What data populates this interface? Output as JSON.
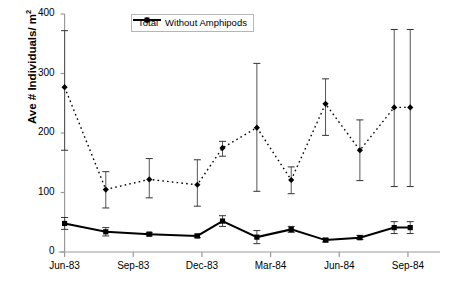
{
  "chart_data": {
    "type": "line",
    "title": "",
    "xlabel": "",
    "ylabel": "Ave # Individuals/ m",
    "ylabel_sup": "2",
    "ylim": [
      0,
      400
    ],
    "yticks": [
      0,
      100,
      200,
      300,
      400
    ],
    "ytick_labels": [
      "0",
      "100",
      "200",
      "300",
      "400"
    ],
    "xtick_labels": [
      "Jun-83",
      "Sep-83",
      "Dec-83",
      "Mar-84",
      "Jun-84",
      "Sep-84"
    ],
    "xtick_months": [
      0,
      3,
      6,
      9,
      12,
      15
    ],
    "xlim_months": [
      -0.2,
      16.4
    ],
    "grid": false,
    "legend_position": "top-center",
    "x_months": [
      0,
      1.8,
      3.7,
      5.8,
      6.9,
      8.4,
      9.9,
      11.4,
      12.9,
      14.4,
      15.1
    ],
    "series": [
      {
        "name": "Total",
        "style": "dashed",
        "marker": "diamond",
        "color": "#000000",
        "values": [
          277,
          105,
          122,
          113,
          175,
          209,
          121,
          249,
          171,
          243,
          243
        ],
        "err_low": [
          171,
          74,
          91,
          77,
          161,
          102,
          98,
          196,
          120,
          110,
          110
        ],
        "err_high": [
          372,
          135,
          157,
          155,
          186,
          317,
          143,
          291,
          222,
          374,
          374
        ]
      },
      {
        "name": "Without Amphipods",
        "style": "solid",
        "marker": "square",
        "color": "#000000",
        "values": [
          48,
          34,
          30,
          27,
          52,
          25,
          38,
          20,
          24,
          41,
          41
        ],
        "err_low": [
          38,
          27,
          27,
          24,
          43,
          14,
          33,
          17,
          21,
          31,
          31
        ],
        "err_high": [
          58,
          41,
          33,
          30,
          61,
          36,
          43,
          23,
          28,
          51,
          51
        ]
      }
    ]
  },
  "legend": {
    "entries": [
      {
        "label": "Total",
        "style": "dashed",
        "marker": "diamond"
      },
      {
        "label": "Without Amphipods",
        "style": "solid",
        "marker": "square"
      }
    ]
  },
  "colors": {
    "axis": "#9a9a9a",
    "series": "#000000",
    "legend_border": "#b6b6b6",
    "background": "#ffffff"
  }
}
